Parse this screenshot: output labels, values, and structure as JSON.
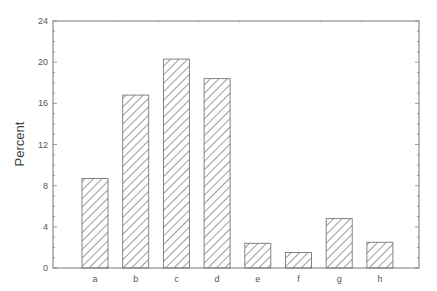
{
  "chart_data": {
    "type": "bar",
    "title": "",
    "xlabel": "",
    "ylabel": "Percent",
    "categories": [
      "a",
      "b",
      "c",
      "d",
      "e",
      "f",
      "g",
      "h"
    ],
    "values": [
      8.7,
      16.8,
      20.3,
      18.4,
      2.4,
      1.5,
      4.8,
      2.5
    ],
    "ylim": [
      0,
      24
    ],
    "yticks": [
      0,
      4,
      8,
      12,
      16,
      20,
      24
    ],
    "y_minor_step": 1,
    "grid": false,
    "legend": null,
    "bar_fill": "diagonal-hatch",
    "colors": {
      "frame": "#777777",
      "hatch": "#666666",
      "text": "#555555"
    }
  }
}
